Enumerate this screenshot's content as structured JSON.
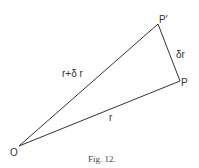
{
  "figure": {
    "caption": "Fig. 12.",
    "points": {
      "O": {
        "label": "O",
        "x": 19,
        "y": 146
      },
      "P": {
        "label": "P",
        "x": 180,
        "y": 81
      },
      "P_prime": {
        "label": "P′",
        "x": 158,
        "y": 24
      }
    },
    "edges": [
      {
        "from": "O",
        "to": "P",
        "label": "r"
      },
      {
        "from": "O",
        "to": "P_prime",
        "label": "r+δ r"
      },
      {
        "from": "P",
        "to": "P_prime",
        "label": "δr"
      }
    ],
    "colors": {
      "line": "#333333",
      "background": "#ffffff"
    }
  }
}
